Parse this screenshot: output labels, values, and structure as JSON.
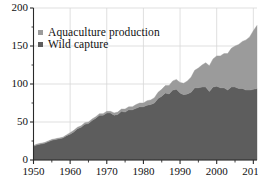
{
  "chart_data": {
    "type": "area",
    "stacked": true,
    "title": "",
    "subtitle": "",
    "xlabel": "",
    "ylabel": "",
    "xlim": [
      1950,
      2011
    ],
    "ylim": [
      0,
      200
    ],
    "y_ticks": [
      0,
      50,
      100,
      150,
      200
    ],
    "y_tick_labels": [
      "0",
      "50",
      "100",
      "150",
      "200"
    ],
    "y_minor_ticks": [
      25,
      75,
      125,
      175
    ],
    "x_ticks": [
      1950,
      1960,
      1970,
      1980,
      1990,
      2000,
      2010
    ],
    "x_tick_labels": [
      "1950",
      "1960",
      "1970",
      "1980",
      "1990",
      "2000",
      "2010"
    ],
    "grid": "both-light",
    "legend_position": "top-left",
    "x": [
      1950,
      1951,
      1952,
      1953,
      1954,
      1955,
      1956,
      1957,
      1958,
      1959,
      1960,
      1961,
      1962,
      1963,
      1964,
      1965,
      1966,
      1967,
      1968,
      1969,
      1970,
      1971,
      1972,
      1973,
      1974,
      1975,
      1976,
      1977,
      1978,
      1979,
      1980,
      1981,
      1982,
      1983,
      1984,
      1985,
      1986,
      1987,
      1988,
      1989,
      1990,
      1991,
      1992,
      1993,
      1994,
      1995,
      1996,
      1997,
      1998,
      1999,
      2000,
      2001,
      2002,
      2003,
      2004,
      2005,
      2006,
      2007,
      2008,
      2009,
      2010,
      2011
    ],
    "series": [
      {
        "name": "Wild capture",
        "color": "#5d5d5d",
        "values": [
          18,
          20,
          21,
          22,
          24,
          26,
          27,
          28,
          29,
          32,
          34,
          37,
          41,
          43,
          47,
          48,
          52,
          55,
          59,
          59,
          62,
          62,
          59,
          60,
          64,
          63,
          66,
          66,
          68,
          70,
          70,
          72,
          73,
          75,
          81,
          84,
          88,
          87,
          92,
          93,
          88,
          86,
          87,
          89,
          95,
          95,
          96,
          96,
          90,
          96,
          97,
          95,
          95,
          92,
          96,
          96,
          94,
          94,
          92,
          92,
          93,
          94
        ]
      },
      {
        "name": "Aquaculture production",
        "color": "#9b9b9b",
        "values": [
          1,
          1,
          1,
          1,
          1,
          1,
          1,
          1,
          1,
          1,
          2,
          2,
          2,
          2,
          2,
          2,
          2,
          2,
          2,
          2,
          2,
          2,
          3,
          3,
          3,
          4,
          4,
          4,
          5,
          5,
          5,
          6,
          6,
          7,
          8,
          9,
          10,
          11,
          12,
          13,
          14,
          15,
          17,
          20,
          23,
          26,
          29,
          32,
          34,
          37,
          40,
          42,
          45,
          48,
          51,
          54,
          58,
          62,
          66,
          70,
          77,
          83
        ]
      }
    ]
  },
  "legend": {
    "items": [
      {
        "label": "Aquaculture production",
        "color": "#9b9b9b"
      },
      {
        "label": "Wild capture",
        "color": "#5d5d5d"
      }
    ]
  },
  "axes": {
    "y_tick_labels": [
      "200",
      "150",
      "100",
      "50",
      "0"
    ],
    "x_tick_labels": [
      "1950",
      "1960",
      "1970",
      "1980",
      "1990",
      "2000",
      "2010"
    ]
  }
}
